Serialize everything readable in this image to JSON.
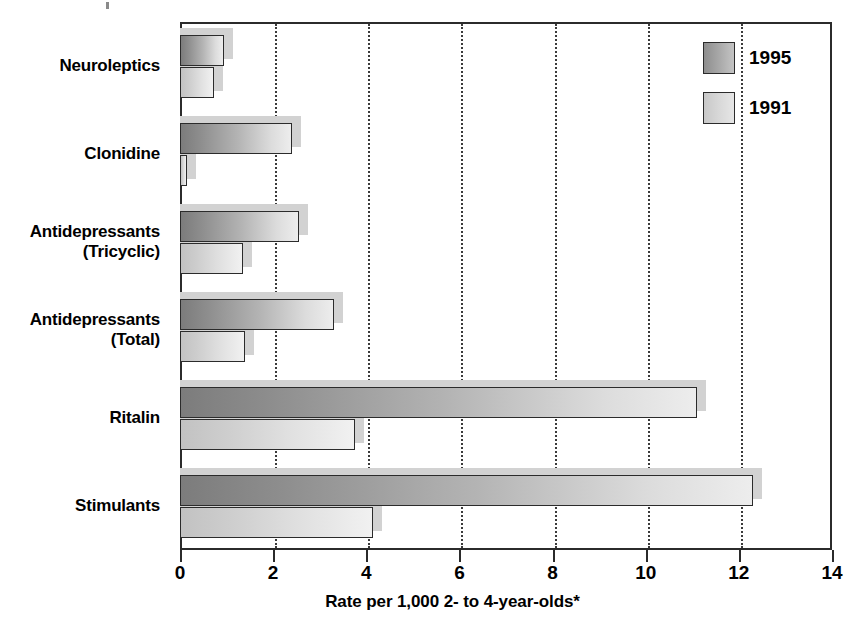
{
  "chart_data": {
    "type": "bar",
    "orientation": "horizontal",
    "title": "",
    "xlabel": "Rate per 1,000 2- to 4-year-olds*",
    "ylabel": "",
    "xlim": [
      0,
      14
    ],
    "xticks": [
      0,
      2,
      4,
      6,
      8,
      10,
      12,
      14
    ],
    "xtick_labels": [
      "0",
      "2",
      "4",
      "6",
      "8",
      "10",
      "12",
      "14"
    ],
    "grid": "vertical-dotted",
    "legend_position": "top-right",
    "categories": [
      "Neuroleptics",
      "Clonidine",
      "Antidepressants\n(Tricyclic)",
      "Antidepressants\n(Total)",
      "Ritalin",
      "Stimulants"
    ],
    "series": [
      {
        "name": "1995",
        "color": "#8e8e8e",
        "values": [
          0.95,
          2.4,
          2.55,
          3.3,
          11.1,
          12.3
        ]
      },
      {
        "name": "1991",
        "color": "#d2d2d2",
        "values": [
          0.73,
          0.15,
          1.35,
          1.4,
          3.75,
          4.15
        ]
      }
    ]
  },
  "legend": {
    "items": [
      {
        "label": "1995",
        "swatch": "y1995"
      },
      {
        "label": "1991",
        "swatch": "y1991"
      }
    ]
  },
  "axis": {
    "x_title": "Rate per 1,000 2- to 4-year-olds*"
  },
  "colors": {
    "bar_1995_dark": "#7c7c7c",
    "bar_1995_light": "#ededed",
    "bar_1991_dark": "#c2c2c2",
    "bar_1991_light": "#f1f1f1",
    "axis_line": "#2b2b2b",
    "gridline": "#3a3a3a",
    "background": "#ffffff"
  }
}
